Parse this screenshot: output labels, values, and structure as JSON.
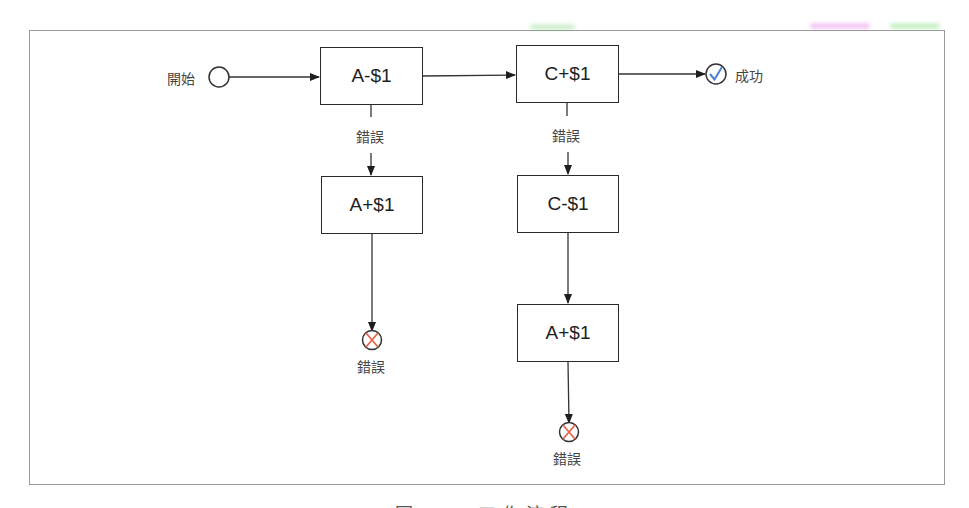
{
  "diagram": {
    "start": {
      "label": "開始"
    },
    "success": {
      "label": "成功",
      "icon": "check-circle-icon",
      "color": "#4a7fd6"
    },
    "error_label": "錯誤",
    "error_icon": {
      "name": "x-circle-icon",
      "color": "#e8654a"
    },
    "nodes": [
      {
        "id": "a_minus",
        "label": "A-$1"
      },
      {
        "id": "c_plus",
        "label": "C+$1"
      },
      {
        "id": "a_plus_left",
        "label": "A+$1"
      },
      {
        "id": "c_minus",
        "label": "C-$1"
      },
      {
        "id": "a_plus_right",
        "label": "A+$1"
      }
    ],
    "edges": [
      {
        "from": "start",
        "to": "a_minus"
      },
      {
        "from": "a_minus",
        "to": "c_plus"
      },
      {
        "from": "c_plus",
        "to": "success"
      },
      {
        "from": "a_minus",
        "to": "a_plus_left",
        "label": "錯誤"
      },
      {
        "from": "a_plus_left",
        "to": "error_left"
      },
      {
        "from": "c_plus",
        "to": "c_minus",
        "label": "錯誤"
      },
      {
        "from": "c_minus",
        "to": "a_plus_right"
      },
      {
        "from": "a_plus_right",
        "to": "error_right"
      }
    ],
    "terminal_labels": {
      "error_left": "錯誤",
      "error_right": "錯誤"
    },
    "edge_labels": {
      "a_minus_error": "錯誤",
      "c_plus_error": "錯誤"
    }
  },
  "caption": {
    "text": "圖 ... 工作流程"
  },
  "colors": {
    "stroke": "#2a2a2a",
    "frame": "#9a9a9a",
    "error": "#e8654a",
    "success": "#4a7fd6"
  }
}
